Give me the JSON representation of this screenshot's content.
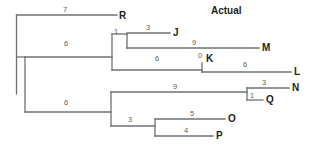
{
  "figure": {
    "title": "Actual",
    "title_x": 211,
    "title_y": 6,
    "width": 320,
    "height": 154,
    "background": "#ffffff",
    "line_color": "#6e7275",
    "label_color": "#231f20",
    "length_color": "#5c6063"
  },
  "chart_data": {
    "type": "tree",
    "title": "Actual",
    "xlabel": "",
    "ylabel": "",
    "grid": false,
    "legend": "none",
    "taxa": [
      "R",
      "J",
      "M",
      "K",
      "L",
      "N",
      "Q",
      "O",
      "P"
    ],
    "branch_labels": [
      "7",
      "3",
      "1",
      "9",
      "6",
      "0",
      "6",
      "6",
      "3",
      "9",
      "1",
      "6",
      "3",
      "5",
      "4"
    ],
    "edges": [
      {
        "id": "root-to-R",
        "label": "7",
        "child": "R"
      },
      {
        "id": "root-to-upper",
        "label": "6",
        "child": "clade-JMKL"
      },
      {
        "id": "root-to-lower",
        "label": "6",
        "child": "clade-NQOP"
      },
      {
        "id": "upper-to-JM",
        "label": "1",
        "child": "clade-JM"
      },
      {
        "id": "JM-to-J",
        "label": "3",
        "child": "J"
      },
      {
        "id": "JM-to-M",
        "label": "9",
        "child": "M"
      },
      {
        "id": "upper-to-K",
        "label": "6",
        "child": "K"
      },
      {
        "id": "K-stub",
        "label": "0",
        "child": "K"
      },
      {
        "id": "K-to-L",
        "label": "6",
        "child": "L"
      },
      {
        "id": "lower-to-NQ",
        "label": "9",
        "child": "clade-NQ"
      },
      {
        "id": "NQ-to-N",
        "label": "3",
        "child": "N"
      },
      {
        "id": "NQ-to-Q",
        "label": "1",
        "child": "Q"
      },
      {
        "id": "lower-to-OP",
        "label": "3",
        "child": "clade-OP"
      },
      {
        "id": "OP-to-O",
        "label": "5",
        "child": "O"
      },
      {
        "id": "OP-to-P",
        "label": "4",
        "child": "P"
      }
    ]
  },
  "taxon_labels": [
    {
      "name": "taxon-label-R",
      "text": "R",
      "x": 119,
      "y": 11
    },
    {
      "name": "taxon-label-J",
      "text": "J",
      "x": 173,
      "y": 28
    },
    {
      "name": "taxon-label-M",
      "text": "M",
      "x": 262,
      "y": 43
    },
    {
      "name": "taxon-label-K",
      "text": "K",
      "x": 206,
      "y": 54
    },
    {
      "name": "taxon-label-L",
      "text": "L",
      "x": 294,
      "y": 67
    },
    {
      "name": "taxon-label-N",
      "text": "N",
      "x": 292,
      "y": 83
    },
    {
      "name": "taxon-label-Q",
      "text": "Q",
      "x": 266,
      "y": 95
    },
    {
      "name": "taxon-label-O",
      "text": "O",
      "x": 228,
      "y": 114
    },
    {
      "name": "taxon-label-P",
      "text": "P",
      "x": 216,
      "y": 131
    }
  ],
  "branch_length_labels": [
    {
      "name": "branch-length-root-R",
      "text": "7",
      "x": 63,
      "y": 6
    },
    {
      "name": "branch-length-JM-J",
      "text": "3",
      "x": 146,
      "y": 24
    },
    {
      "name": "branch-length-upper-JM",
      "text": "1",
      "x": 114,
      "y": 28
    },
    {
      "name": "branch-length-root-upper",
      "text": "6",
      "x": 64,
      "y": 40
    },
    {
      "name": "branch-length-JM-M",
      "text": "9",
      "x": 192,
      "y": 39
    },
    {
      "name": "branch-length-K-stub",
      "text": "0",
      "x": 198,
      "y": 52
    },
    {
      "name": "branch-length-upper-K",
      "text": "6",
      "x": 155,
      "y": 55
    },
    {
      "name": "branch-length-K-L",
      "text": "6",
      "x": 243,
      "y": 61
    },
    {
      "name": "branch-length-NQ-N",
      "text": "3",
      "x": 262,
      "y": 79
    },
    {
      "name": "branch-length-lower-NQ",
      "text": "9",
      "x": 173,
      "y": 83
    },
    {
      "name": "branch-length-NQ-Q",
      "text": "1",
      "x": 250,
      "y": 92
    },
    {
      "name": "branch-length-root-lower",
      "text": "6",
      "x": 64,
      "y": 99
    },
    {
      "name": "branch-length-OP-O",
      "text": "5",
      "x": 190,
      "y": 110
    },
    {
      "name": "branch-length-lower-OP",
      "text": "3",
      "x": 128,
      "y": 116
    },
    {
      "name": "branch-length-OP-P",
      "text": "4",
      "x": 184,
      "y": 127
    }
  ],
  "tree_paths": [
    {
      "name": "edge-root-spine",
      "d": "M 16.5 15 L 16.5 94"
    },
    {
      "name": "edge-root-to-R",
      "d": "M 16.5 15 L 117 15"
    },
    {
      "name": "edge-root-to-upper-node",
      "d": "M 16.5 57 L 25 57"
    },
    {
      "name": "edge-upper-spine",
      "d": "M 25 57 L 25 112"
    },
    {
      "name": "edge-upper-horizontal",
      "d": "M 25 57 L 112 57"
    },
    {
      "name": "edge-upper-node-spine",
      "d": "M 112 34 L 112 70"
    },
    {
      "name": "edge-upper-to-JM",
      "d": "M 112 34 L 127 34"
    },
    {
      "name": "edge-JM-spine",
      "d": "M 127 34 L 127 48"
    },
    {
      "name": "edge-JM-to-J",
      "d": "M 127 33 L 170 33"
    },
    {
      "name": "edge-JM-to-M",
      "d": "M 127 48 L 259 48"
    },
    {
      "name": "edge-upper-to-K",
      "d": "M 112 70 L 202 70"
    },
    {
      "name": "edge-K-spine",
      "d": "M 202 63 L 202 72"
    },
    {
      "name": "edge-K-to-L",
      "d": "M 202 72 L 291 72"
    },
    {
      "name": "edge-lower-horizontal",
      "d": "M 25 112 L 111 112"
    },
    {
      "name": "edge-lower-node-spine",
      "d": "M 111 92 L 111 126"
    },
    {
      "name": "edge-lower-to-NQ",
      "d": "M 111 92 L 247 92"
    },
    {
      "name": "edge-NQ-spine",
      "d": "M 247 88 L 247 100"
    },
    {
      "name": "edge-NQ-to-N",
      "d": "M 247 88 L 289 88"
    },
    {
      "name": "edge-NQ-to-Q",
      "d": "M 247 100 L 263 100"
    },
    {
      "name": "edge-lower-to-OP",
      "d": "M 111 126 L 155 126"
    },
    {
      "name": "edge-OP-spine",
      "d": "M 155 119 L 155 136"
    },
    {
      "name": "edge-OP-to-O",
      "d": "M 155 119 L 225 119"
    },
    {
      "name": "edge-OP-to-P",
      "d": "M 155 136 L 213 136"
    }
  ]
}
